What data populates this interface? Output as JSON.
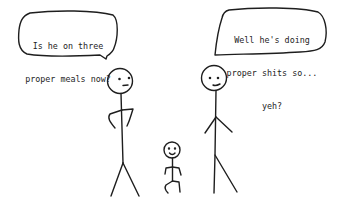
{
  "comic": {
    "left_bubble": {
      "line1": "Is he on three",
      "line2": "proper meals now?"
    },
    "right_bubble": {
      "line1": "Well he's doing",
      "line2": "proper shits so...",
      "line3": "yeh?"
    },
    "colors": {
      "ink": "#1e1e1e",
      "background": "#ffffff"
    }
  }
}
